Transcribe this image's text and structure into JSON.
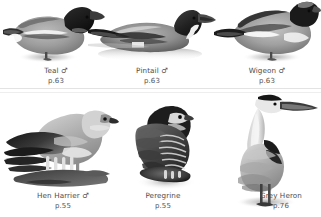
{
  "plate": {
    "background_color": "#ffffff",
    "text_color": "#4d4d4d",
    "divider_color": "#e3e3e3",
    "rows": 2,
    "columns": 3
  },
  "species": [
    {
      "id": "teal",
      "name": "Teal",
      "sex_symbol": "♂",
      "page": "p.63",
      "icon": "teal-duck-illustration",
      "row": 1,
      "column": 1
    },
    {
      "id": "pintail",
      "name": "Pintail",
      "sex_symbol": "♂",
      "page": "p.63",
      "icon": "pintail-duck-illustration",
      "row": 1,
      "column": 2
    },
    {
      "id": "wigeon",
      "name": "Wigeon",
      "sex_symbol": "♂",
      "page": "p.63",
      "icon": "wigeon-duck-illustration",
      "row": 1,
      "column": 3
    },
    {
      "id": "hen-harrier",
      "name": "Hen Harrier",
      "sex_symbol": "♂",
      "page": "p.55",
      "icon": "hen-harrier-illustration",
      "row": 2,
      "column": 1
    },
    {
      "id": "peregrine",
      "name": "Peregrine",
      "sex_symbol": "",
      "page": "p.55",
      "icon": "peregrine-falcon-illustration",
      "row": 2,
      "column": 2
    },
    {
      "id": "grey-heron",
      "name": "Grey Heron",
      "sex_symbol": "",
      "page": "p.76",
      "icon": "grey-heron-illustration",
      "row": 2,
      "column": 3
    }
  ]
}
